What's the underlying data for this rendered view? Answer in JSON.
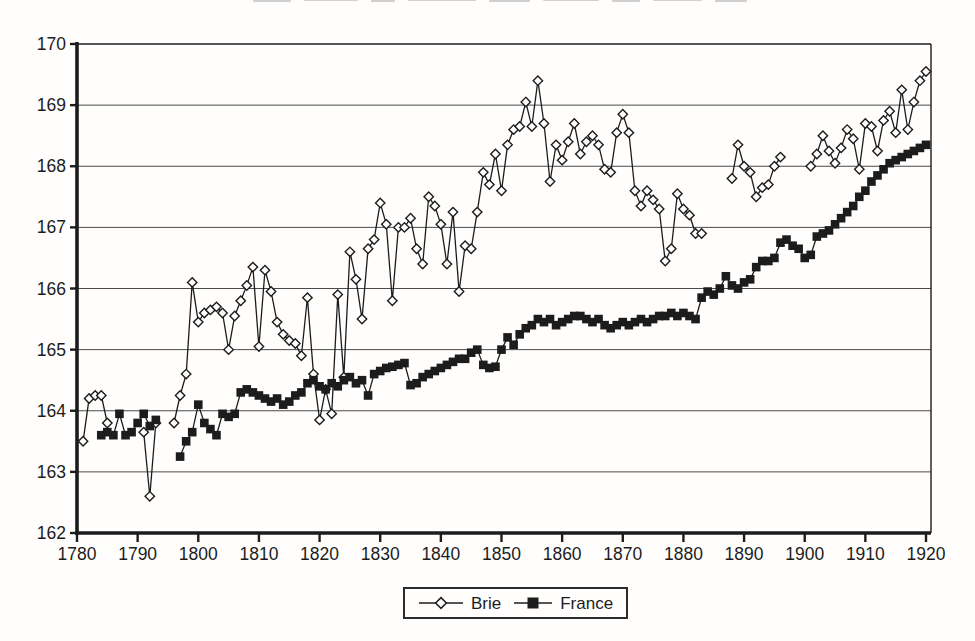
{
  "figure": {
    "background": "#fffefd",
    "ink": "#1c1c1c",
    "gridline_color": "#4a4a4a"
  },
  "legend": {
    "items": [
      {
        "label": "Brie",
        "marker": "open-diamond"
      },
      {
        "label": "France",
        "marker": "filled-square"
      }
    ]
  },
  "chart_data": {
    "type": "line",
    "xlabel": "",
    "ylabel": "",
    "xlim": [
      1780,
      1920
    ],
    "ylim": [
      162,
      170
    ],
    "grid": "horizontal",
    "legend_position": "bottom-center",
    "x_ticks": [
      1780,
      1790,
      1800,
      1810,
      1820,
      1830,
      1840,
      1850,
      1860,
      1870,
      1880,
      1890,
      1900,
      1910,
      1920
    ],
    "y_ticks": [
      162,
      163,
      164,
      165,
      166,
      167,
      168,
      169,
      170
    ],
    "series": [
      {
        "name": "Brie",
        "marker": "open-diamond",
        "segments": [
          {
            "start_year": 1781,
            "values": [
              163.5,
              164.2,
              164.25,
              164.25,
              163.8
            ]
          },
          {
            "start_year": 1791,
            "values": [
              163.65,
              162.6,
              163.8
            ]
          },
          {
            "start_year": 1796,
            "values": [
              163.8,
              164.25,
              164.6,
              166.1,
              165.45,
              165.6,
              165.65,
              165.7,
              165.6,
              165.0,
              165.55,
              165.8,
              166.05,
              166.35,
              165.05,
              166.3,
              165.95,
              165.45,
              165.25,
              165.15,
              165.1,
              164.9,
              165.85,
              164.6,
              163.85,
              164.35,
              163.95,
              165.9,
              164.55,
              166.6,
              166.15,
              165.5,
              166.65,
              166.8,
              167.4,
              167.05,
              165.8,
              167.0,
              167.0,
              167.15,
              166.65,
              166.4,
              167.5,
              167.35,
              167.05,
              166.4,
              167.25,
              165.95,
              166.7,
              166.65,
              167.25,
              167.9,
              167.7,
              168.2,
              167.6,
              168.35,
              168.6,
              168.65,
              169.05,
              168.65,
              169.4,
              168.7,
              167.75,
              168.35,
              168.1,
              168.4,
              168.7,
              168.2,
              168.4,
              168.5,
              168.35,
              167.95,
              167.9,
              168.55,
              168.85,
              168.55,
              167.6,
              167.35,
              167.6,
              167.45,
              167.3,
              166.45,
              166.65,
              167.55,
              167.3,
              167.2,
              166.9,
              166.9
            ]
          },
          {
            "start_year": 1888,
            "values": [
              167.8,
              168.35,
              168.0,
              167.9,
              167.5,
              167.65,
              167.7,
              168.0,
              168.15
            ]
          },
          {
            "start_year": 1901,
            "values": [
              168.0,
              168.2,
              168.5,
              168.25,
              168.05,
              168.3,
              168.6,
              168.45,
              167.95,
              168.7,
              168.65,
              168.25,
              168.75,
              168.9,
              168.55,
              169.25,
              168.6,
              169.05,
              169.4,
              169.55
            ]
          }
        ]
      },
      {
        "name": "France",
        "marker": "filled-square",
        "segments": [
          {
            "start_year": 1784,
            "values": [
              163.6,
              163.65,
              163.6,
              163.95,
              163.6,
              163.65,
              163.8,
              163.95,
              163.75,
              163.85
            ]
          },
          {
            "start_year": 1797,
            "values": [
              163.25,
              163.5,
              163.65,
              164.1,
              163.8,
              163.7,
              163.6,
              163.95,
              163.9,
              163.95,
              164.3,
              164.35,
              164.3,
              164.25,
              164.2,
              164.15,
              164.2,
              164.1,
              164.15,
              164.25,
              164.3,
              164.45,
              164.5,
              164.4,
              164.35,
              164.45,
              164.4,
              164.5,
              164.55,
              164.45,
              164.5,
              164.25,
              164.6,
              164.65,
              164.7,
              164.72,
              164.75,
              164.78,
              164.42,
              164.45,
              164.55,
              164.6,
              164.65,
              164.7,
              164.75,
              164.8,
              164.85,
              164.85,
              164.95,
              165.0,
              164.75,
              164.7,
              164.72,
              165.0,
              165.2,
              165.08,
              165.25,
              165.35,
              165.4,
              165.5,
              165.45,
              165.5,
              165.4,
              165.45,
              165.5,
              165.55,
              165.55,
              165.5,
              165.45,
              165.5,
              165.4,
              165.35,
              165.4,
              165.45,
              165.4,
              165.45,
              165.5,
              165.45,
              165.5,
              165.55,
              165.55,
              165.6,
              165.55,
              165.6,
              165.55,
              165.5,
              165.85,
              165.95,
              165.9,
              166.0,
              166.2,
              166.05,
              166.0,
              166.1,
              166.15,
              166.35,
              166.45,
              166.45,
              166.5,
              166.75,
              166.8,
              166.7,
              166.65,
              166.5,
              166.55,
              166.85,
              166.9,
              166.95,
              167.05,
              167.15,
              167.25,
              167.35,
              167.5,
              167.6,
              167.75,
              167.85,
              167.95,
              168.05,
              168.1,
              168.15,
              168.2,
              168.25,
              168.3,
              168.35
            ]
          }
        ]
      }
    ]
  }
}
